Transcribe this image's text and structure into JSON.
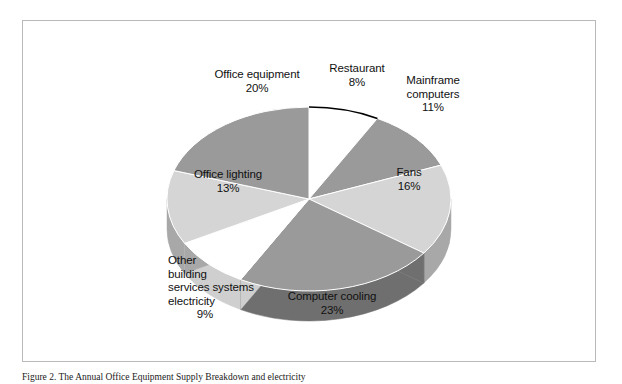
{
  "figure": {
    "caption": "Figure 2. The Annual Office Equipment Supply Breakdown and electricity",
    "frame_color": "#b9b9b9",
    "background": "#ffffff"
  },
  "chart_data": {
    "type": "pie",
    "title": "",
    "subtitle": "",
    "xlabel": "",
    "ylabel": "",
    "three_d": true,
    "start_angle_deg": 0,
    "direction": "clockwise",
    "legend_position": "none",
    "labels_position": "outside",
    "total_percent": 100,
    "categories": [
      "Restaurant",
      "Mainframe computers",
      "Fans",
      "Computer cooling",
      "Other building services systems electricity",
      "Office lighting",
      "Office equipment"
    ],
    "values": [
      8,
      11,
      16,
      23,
      9,
      13,
      20
    ],
    "value_labels": [
      "8%",
      "11%",
      "16%",
      "23%",
      "9%",
      "13%",
      "20%"
    ],
    "colors": [
      "#ffffff",
      "#9a9a9a",
      "#d5d5d5",
      "#9a9a9a",
      "#ffffff",
      "#d5d5d5",
      "#9a9a9a"
    ],
    "side_colors": [
      "#cfcfcf",
      "#6f6f6f",
      "#a8a8a8",
      "#6f6f6f",
      "#cfcfcf",
      "#a8a8a8",
      "#6f6f6f"
    ],
    "slices": [
      {
        "name": "Restaurant",
        "percent": 8,
        "label": "Restaurant",
        "pct_text": "8%",
        "top_color": "#ffffff",
        "side_color": "#cfcfcf"
      },
      {
        "name": "Mainframe computers",
        "percent": 11,
        "label": "Mainframe\ncomputers",
        "pct_text": "11%",
        "top_color": "#9a9a9a",
        "side_color": "#6f6f6f"
      },
      {
        "name": "Fans",
        "percent": 16,
        "label": "Fans",
        "pct_text": "16%",
        "top_color": "#d5d5d5",
        "side_color": "#a8a8a8"
      },
      {
        "name": "Computer cooling",
        "percent": 23,
        "label": "Computer cooling",
        "pct_text": "23%",
        "top_color": "#9a9a9a",
        "side_color": "#6f6f6f"
      },
      {
        "name": "Other building services systems electricity",
        "percent": 9,
        "label": "Other building services systems electricity",
        "pct_text": "9%",
        "top_color": "#ffffff",
        "side_color": "#cfcfcf"
      },
      {
        "name": "Office lighting",
        "percent": 13,
        "label": "Office lighting",
        "pct_text": "13%",
        "top_color": "#d5d5d5",
        "side_color": "#a8a8a8"
      },
      {
        "name": "Office equipment",
        "percent": 20,
        "label": "Office equipment",
        "pct_text": "20%",
        "top_color": "#9a9a9a",
        "side_color": "#6f6f6f"
      }
    ]
  },
  "labels": {
    "office_equipment": {
      "name": "Office equipment",
      "pct": "20%"
    },
    "restaurant": {
      "name": "Restaurant",
      "pct": "8%"
    },
    "mainframe_line1": "Mainframe",
    "mainframe_line2": "computers",
    "mainframe_pct": "11%",
    "fans": {
      "name": "Fans",
      "pct": "16%"
    },
    "computer_cooling": {
      "name": "Computer cooling",
      "pct": "23%"
    },
    "other_line1": "Other",
    "other_line2": "building",
    "other_line3": "services systems",
    "other_line4": "electricity",
    "other_pct": "9%",
    "office_lighting": {
      "name": "Office lighting",
      "pct": "13%"
    }
  }
}
